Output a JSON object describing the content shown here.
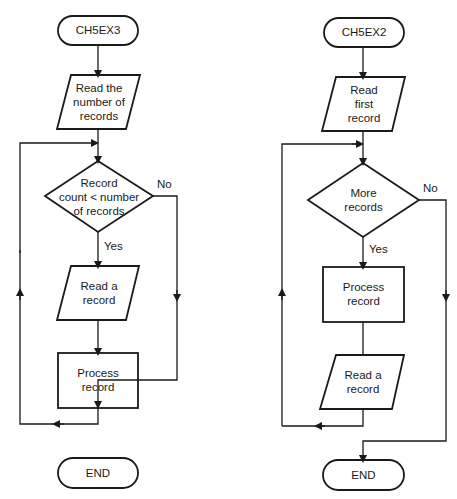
{
  "flowcharts": [
    {
      "id": "ch5ex3",
      "start": "CH5EX3",
      "steps": [
        {
          "type": "io",
          "text": "Read the\nnumber of\nrecords"
        },
        {
          "type": "decision",
          "text": "Record\ncount < number\nof records",
          "yes": "Yes",
          "no": "No"
        },
        {
          "type": "io",
          "text": "Read a\nrecord"
        },
        {
          "type": "process",
          "text": "Process\nrecord"
        }
      ],
      "end": "END"
    },
    {
      "id": "ch5ex2",
      "start": "CH5EX2",
      "steps": [
        {
          "type": "io",
          "text": "Read\nfirst\nrecord"
        },
        {
          "type": "decision",
          "text": "More\nrecords",
          "yes": "Yes",
          "no": "No"
        },
        {
          "type": "process",
          "text": "Process\nrecord"
        },
        {
          "type": "io",
          "text": "Read a\nrecord"
        }
      ],
      "end": "END"
    }
  ],
  "colors": {
    "stroke": "#1a1a1a",
    "background": "#ffffff"
  }
}
